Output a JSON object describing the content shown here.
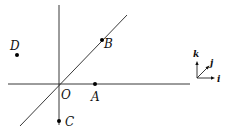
{
  "diagram": {
    "type": "3d-coordinate-axes-with-points",
    "origin_label": "O",
    "points": [
      {
        "id": "A",
        "label": "A",
        "position": "on horizontal axis, right of origin"
      },
      {
        "id": "B",
        "label": "B",
        "position": "on diagonal axis, upper right"
      },
      {
        "id": "C",
        "label": "C",
        "position": "on vertical axis, below origin"
      },
      {
        "id": "D",
        "label": "D",
        "position": "off-axis, upper left"
      }
    ],
    "basis": {
      "i": "i",
      "j": "j",
      "k": "k"
    },
    "colors": {
      "ink": "#111111",
      "background": "#ffffff"
    }
  }
}
